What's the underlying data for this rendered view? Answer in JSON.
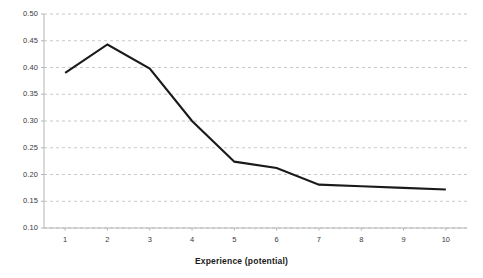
{
  "chart_data": {
    "type": "line",
    "title": "",
    "subtitle": "",
    "xlabel": "Experience (potential)",
    "ylabel": "",
    "x": [
      1,
      2,
      3,
      4,
      5,
      6,
      7,
      8,
      9,
      10
    ],
    "categories": [
      "1",
      "2",
      "3",
      "4",
      "5",
      "6",
      "7",
      "8",
      "9",
      "10"
    ],
    "values": [
      0.39,
      0.443,
      0.398,
      0.3,
      0.224,
      0.212,
      0.181,
      0.178,
      0.175,
      0.172
    ],
    "series": [
      {
        "name": "",
        "values": [
          0.39,
          0.443,
          0.398,
          0.3,
          0.224,
          0.212,
          0.181,
          0.178,
          0.175,
          0.172
        ]
      }
    ],
    "ylim": [
      0.1,
      0.5
    ],
    "xlim": [
      0.5,
      10.5
    ],
    "ytick_labels": [
      "0.50",
      "0.45",
      "0.40",
      "0.35",
      "0.30",
      "0.25",
      "0.20",
      "0.15",
      "0.10"
    ],
    "ytick_values": [
      0.5,
      0.45,
      0.4,
      0.35,
      0.3,
      0.25,
      0.2,
      0.15,
      0.1
    ],
    "xtick_labels": [
      "1",
      "2",
      "3",
      "4",
      "5",
      "6",
      "7",
      "8",
      "9",
      "10"
    ],
    "grid": "horizontal-dashed",
    "legend": "none",
    "line_color": "#1a1a1a",
    "grid_color": "#c8c8c8",
    "axis_color": "#b4b4b4",
    "background_color": "#ffffff",
    "annotations": []
  }
}
